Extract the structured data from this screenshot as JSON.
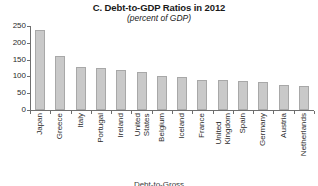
{
  "chart_data": {
    "type": "bar",
    "title": "C. Debt-to-GDP Ratios in 2012",
    "subtitle": "(percent of GDP)",
    "xlabel": "",
    "ylabel": "",
    "ylim": [
      0,
      250
    ],
    "yticks": [
      250,
      200,
      150,
      100,
      50,
      0
    ],
    "grid": false,
    "legend": null,
    "bar_color": "#c9c9c9",
    "bar_border_color": "#a8a8a8",
    "axis_color": "#6e6e6e",
    "categories": [
      "Japan",
      "Greece",
      "Italy",
      "Portugal",
      "Ireland",
      "United States",
      "Belgium",
      "Iceland",
      "France",
      "United Kingdom",
      "Spain",
      "Germany",
      "Austria",
      "Netherlands"
    ],
    "category_lines": [
      [
        "Japan"
      ],
      [
        "Greece"
      ],
      [
        "Italy"
      ],
      [
        "Portugal"
      ],
      [
        "Ireland"
      ],
      [
        "United",
        "States"
      ],
      [
        "Belgium"
      ],
      [
        "Iceland"
      ],
      [
        "France"
      ],
      [
        "United",
        "Kingdom"
      ],
      [
        "Spain"
      ],
      [
        "Germany"
      ],
      [
        "Austria"
      ],
      [
        "Netherlands"
      ]
    ],
    "values": [
      237,
      162,
      127,
      124,
      118,
      112,
      100,
      99,
      90,
      89,
      86,
      82,
      75,
      72
    ]
  },
  "footer": {
    "cut_text": "Debt-to-Gross"
  }
}
